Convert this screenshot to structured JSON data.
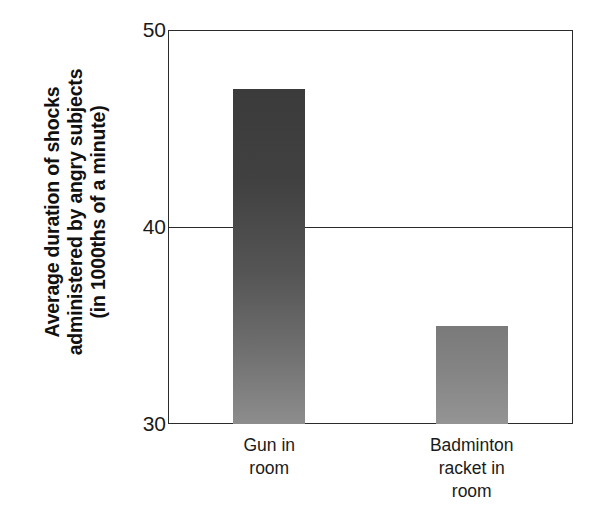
{
  "chart_data": {
    "type": "bar",
    "title": "",
    "subtitle": "",
    "xlabel": "",
    "ylabel": "Average duration of shocks administered by angry subjects (in 1000ths of a minute)",
    "ylabel_lines": [
      "Average duration of shocks",
      "administered by angry subjects",
      "(in 1000ths of a minute)"
    ],
    "categories": [
      "Gun in room",
      "Badminton racket in room"
    ],
    "category_label_lines": [
      [
        "Gun in",
        "room"
      ],
      [
        "Badminton",
        "racket in",
        "room"
      ]
    ],
    "values": [
      47,
      35
    ],
    "ylim": [
      30,
      50
    ],
    "yticks": [
      30,
      40,
      50
    ],
    "ytick_labels": [
      "30",
      "40",
      "50"
    ],
    "grid": true,
    "gridlines_at": [
      40
    ],
    "legend": false,
    "legend_position": "none",
    "bar_colors": [
      "#3b3b3b",
      "#7a7a7a"
    ],
    "axis_color": "#2b2b2b",
    "background_color": "#ffffff"
  },
  "axis": {
    "ticks": {
      "top": "50",
      "middle": "40",
      "bottom": "30"
    }
  },
  "bars": [
    {
      "name": "gun",
      "value": 47,
      "label_lines": [
        "Gun in",
        "room"
      ],
      "color_top": "#3b3b3b",
      "color_bottom": "#8d8d8d"
    },
    {
      "name": "badminton",
      "value": 35,
      "label_lines": [
        "Badminton",
        "racket in",
        "room"
      ],
      "color_top": "#7a7a7a",
      "color_bottom": "#949494"
    }
  ]
}
